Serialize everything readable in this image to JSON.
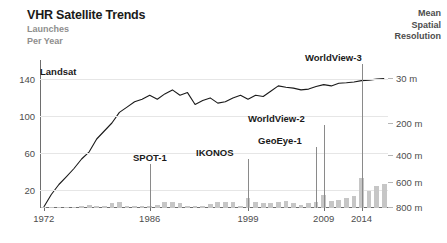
{
  "header": {
    "title": "VHR Satellite Trends",
    "subtitle": "Launches\nPer Year",
    "right_title": "Mean\nSpatial\nResolution"
  },
  "colors": {
    "bar": "#c6c6c6",
    "line": "#1a1a1a",
    "axis": "#6e6e6e",
    "grid": "#e6e6e6",
    "subtitle": "#8e8e8e",
    "text": "#1a1a1a"
  },
  "chart_data": {
    "type": "bar",
    "title": "VHR Satellite Trends",
    "subtitle": "Launches Per Year",
    "xlabel": "",
    "ylabel": "Launches Per Year",
    "y2label": "Mean Spatial Resolution",
    "grid": true,
    "legend": "none",
    "xlim": [
      1972,
      2018
    ],
    "ylim": [
      0,
      160
    ],
    "y2lim_m": [
      800,
      0
    ],
    "y_ticks": [
      20,
      60,
      100,
      140
    ],
    "y_tick_labels": [
      "20",
      "60",
      "100",
      "140"
    ],
    "y2_ticks_m": [
      30,
      200,
      400,
      600,
      800
    ],
    "y2_tick_labels": [
      "30 m",
      "200 m",
      "400 m",
      "600 m",
      "800 m"
    ],
    "x_ticks": [
      1972,
      1986,
      1999,
      2009,
      2014
    ],
    "x_tick_labels": [
      "1972",
      "1986",
      "1999",
      "2009",
      "2014"
    ],
    "categories": [
      1972,
      1973,
      1974,
      1975,
      1976,
      1977,
      1978,
      1979,
      1980,
      1981,
      1982,
      1983,
      1984,
      1985,
      1986,
      1987,
      1988,
      1989,
      1990,
      1991,
      1992,
      1993,
      1994,
      1995,
      1996,
      1997,
      1998,
      1999,
      2000,
      2001,
      2002,
      2003,
      2004,
      2005,
      2006,
      2007,
      2008,
      2009,
      2010,
      2011,
      2012,
      2013,
      2014,
      2015,
      2016,
      2017
    ],
    "series": [
      {
        "name": "Launches Per Year",
        "type": "bar",
        "values": [
          1,
          1,
          1,
          1,
          1,
          2,
          3,
          2,
          2,
          5,
          6,
          2,
          2,
          2,
          2,
          3,
          6,
          7,
          5,
          2,
          2,
          2,
          4,
          6,
          7,
          6,
          2,
          11,
          6,
          5,
          5,
          7,
          8,
          5,
          3,
          5,
          6,
          14,
          8,
          9,
          11,
          13,
          32,
          18,
          24,
          26
        ]
      },
      {
        "name": "Mean Spatial Resolution (m)",
        "type": "line",
        "axis": "right",
        "values_m": [
          800,
          700,
          620,
          560,
          500,
          430,
          380,
          300,
          250,
          200,
          160,
          140,
          120,
          110,
          95,
          110,
          90,
          75,
          95,
          85,
          130,
          115,
          105,
          125,
          120,
          105,
          95,
          110,
          95,
          100,
          80,
          60,
          65,
          68,
          75,
          72,
          62,
          55,
          60,
          50,
          48,
          45,
          40,
          38,
          34,
          32
        ]
      }
    ],
    "annotations": [
      {
        "label": "Landsat",
        "x_year": 1972,
        "label_x_px": 40,
        "label_y_px": 66
      },
      {
        "label": "SPOT-1",
        "x_year": 1986,
        "label_x_px": 133,
        "label_y_px": 152
      },
      {
        "label": "IKONOS",
        "x_year": 1999,
        "label_x_px": 196,
        "label_y_px": 147
      },
      {
        "label": "GeoEye-1",
        "x_year": 2008,
        "label_x_px": 258,
        "label_y_px": 135
      },
      {
        "label": "WorldView-2",
        "x_year": 2009,
        "label_x_px": 248,
        "label_y_px": 113
      },
      {
        "label": "WorldView-3",
        "x_year": 2014,
        "label_x_px": 305,
        "label_y_px": 52
      }
    ]
  }
}
